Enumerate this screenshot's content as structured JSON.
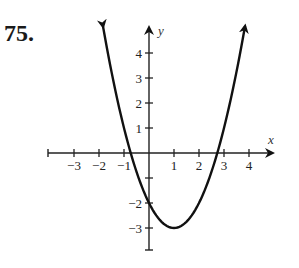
{
  "problem": {
    "number": "75."
  },
  "chart_data": {
    "type": "line",
    "title": "",
    "function": "y = (x - 1)^2 - 3",
    "xlabel": "x",
    "ylabel": "y",
    "xlim": [
      -4,
      5
    ],
    "ylim": [
      -4,
      5
    ],
    "x_ticks": [
      -3,
      -2,
      -1,
      1,
      2,
      3,
      4
    ],
    "x_tick_labels": [
      "−3",
      "−2",
      "−1",
      "1",
      "2",
      "3",
      "4"
    ],
    "y_ticks": [
      4,
      3,
      2,
      1,
      -1,
      -2,
      -3
    ],
    "y_tick_labels": [
      "4",
      "3",
      "2",
      "1",
      "",
      "−2",
      "−3"
    ],
    "vertex": [
      1,
      -3
    ],
    "y_intercept": [
      0,
      -2
    ],
    "x_intercepts": [
      -0.73,
      2.73
    ],
    "x": [
      -1.84,
      -1.5,
      -1,
      -0.5,
      0,
      0.5,
      1,
      1.5,
      2,
      2.5,
      3,
      3.5,
      3.84
    ],
    "y": [
      5.07,
      3.25,
      1,
      -0.75,
      -2,
      -2.75,
      -3,
      -2.75,
      -2,
      -0.75,
      1,
      3.25,
      5.07
    ],
    "arrows_on_curve_ends": true,
    "grid": false,
    "legend": null
  }
}
